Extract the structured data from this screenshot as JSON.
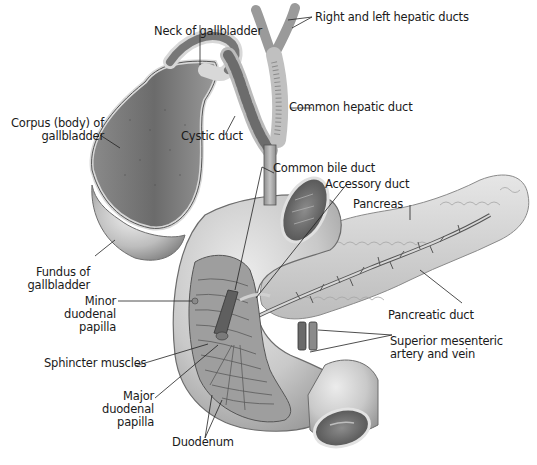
{
  "figure": {
    "colors": {
      "background": "#ffffff",
      "tissue_light": "#d9d9d9",
      "tissue_mid": "#a8a8a8",
      "tissue_dark": "#5e5e5e",
      "outline": "#3a3a3a",
      "label_text": "#1a1a1a",
      "leader_line": "#222222"
    }
  },
  "labels": {
    "neck_of_gallbladder": {
      "lines": [
        "Neck of gallbladder"
      ]
    },
    "right_left_hepatic_ducts": {
      "lines": [
        "Right and left hepatic ducts"
      ]
    },
    "common_hepatic_duct": {
      "lines": [
        "Common hepatic duct"
      ]
    },
    "corpus_of_gallbladder": {
      "lines": [
        "Corpus (body) of",
        "gallbladder"
      ]
    },
    "cystic_duct": {
      "lines": [
        "Cystic duct"
      ]
    },
    "common_bile_duct": {
      "lines": [
        "Common bile duct"
      ]
    },
    "accessory_duct": {
      "lines": [
        "Accessory duct"
      ]
    },
    "pancreas": {
      "lines": [
        "Pancreas"
      ]
    },
    "fundus_of_gallbladder": {
      "lines": [
        "Fundus of",
        "gallbladder"
      ]
    },
    "minor_duodenal_papilla": {
      "lines": [
        "Minor",
        "duodenal",
        "papilla"
      ]
    },
    "pancreatic_duct": {
      "lines": [
        "Pancreatic duct"
      ]
    },
    "superior_mesenteric": {
      "lines": [
        "Superior mesenteric",
        "artery and vein"
      ]
    },
    "sphincter_muscles": {
      "lines": [
        "Sphincter muscles"
      ]
    },
    "major_duodenal_papilla": {
      "lines": [
        "Major",
        "duodenal",
        "papilla"
      ]
    },
    "duodenum": {
      "lines": [
        "Duodenum"
      ]
    }
  }
}
